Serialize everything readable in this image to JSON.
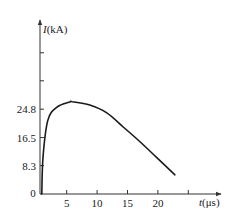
{
  "chart_data": {
    "type": "line",
    "title": "",
    "xlabel": "t(μs)",
    "ylabel": "I(kA)",
    "xlabel_var": "t",
    "xlabel_unit": "(μs)",
    "ylabel_var": "I",
    "ylabel_unit": "(kA)",
    "origin_label": "0",
    "x_ticks": [
      5,
      10,
      15,
      20,
      25
    ],
    "x_tick_labels": [
      "5",
      "10",
      "15",
      "20",
      ""
    ],
    "y_ticks": [
      8.3,
      16.5,
      24.8,
      33.1,
      41.3
    ],
    "y_tick_labels": [
      "8.3",
      "16.5",
      "24.8",
      "",
      ""
    ],
    "xlim": [
      0,
      30
    ],
    "ylim": [
      0,
      46
    ],
    "grid": false,
    "legend": null,
    "series": [
      {
        "name": "lightning current waveform",
        "x": [
          0.9,
          1.1,
          1.9,
          3.4,
          5.5,
          5.9,
          8.8,
          11.6,
          14.3,
          17.1,
          19.9,
          22.8
        ],
        "y": [
          0,
          10.8,
          21.6,
          25.4,
          26.9,
          27.0,
          26.0,
          23.7,
          19.6,
          15.2,
          10.5,
          5.6
        ]
      }
    ],
    "annotations": []
  },
  "colors": {
    "line": "#1a1a1a",
    "axis": "#333333",
    "background": "#ffffff"
  }
}
